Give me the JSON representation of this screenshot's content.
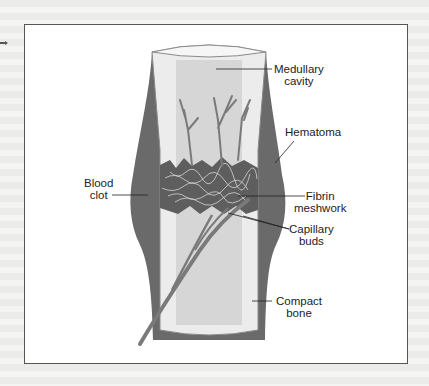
{
  "figure": {
    "labels": {
      "medullary_cavity": [
        "Medullary",
        "cavity"
      ],
      "hematoma": [
        "Hematoma"
      ],
      "blood_clot": [
        "Blood",
        "clot"
      ],
      "fibrin_meshwork": [
        "Fibrin",
        "meshwork"
      ],
      "capillary_buds": [
        "Capillary",
        "buds"
      ],
      "compact_bone": [
        "Compact",
        "bone"
      ]
    },
    "colors": {
      "border": "#555555",
      "hematoma": "#6a6a6a",
      "bone": "#e9e9e9",
      "marrow": "#c9c9c9",
      "vessel": "#7a7a7a",
      "label_text": "#222222"
    }
  }
}
